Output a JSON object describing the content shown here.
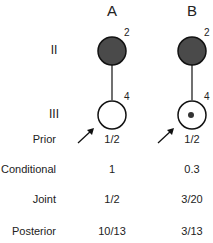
{
  "columns": [
    {
      "label": "A",
      "gen2_number": "2",
      "gen3_number": "4",
      "gen3_carrier": false
    },
    {
      "label": "B",
      "gen2_number": "2",
      "gen3_number": "4",
      "gen3_carrier": true
    }
  ],
  "generations": [
    "II",
    "III"
  ],
  "rows": [
    {
      "label": "Prior",
      "values": [
        "1/2",
        "1/2"
      ]
    },
    {
      "label": "Conditional",
      "values": [
        "1",
        "0.3"
      ]
    },
    {
      "label": "Joint",
      "values": [
        "1/2",
        "3/20"
      ]
    },
    {
      "label": "Posterior",
      "values": [
        "10/13",
        "3/13"
      ]
    }
  ],
  "colors": {
    "affected_fill": "#4a4a4a",
    "line": "#111111"
  }
}
